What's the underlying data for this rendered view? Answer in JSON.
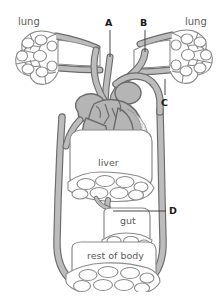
{
  "figure": {
    "background_color": "#ffffff",
    "vessel_fill": "#b9b9b9",
    "vessel_stroke": "#6b6b6b",
    "organ_fill": "#ffffff",
    "capillary_stroke": "#8a8a8a",
    "heart_fill": "#b5b5b5",
    "ventricle_stipple_fill": "#e8e8e8",
    "label_color": "#5a5a5a",
    "letter_color": "#1a1a1a"
  },
  "organs": {
    "lung_left": "lung",
    "lung_right": "lung",
    "liver": "liver",
    "gut": "gut",
    "rest_of_body": "rest of body"
  },
  "letters": {
    "a": "A",
    "b": "B",
    "c": "C",
    "d": "D"
  },
  "structures": [
    {
      "name": "lung-left",
      "type": "capillary-bed",
      "label": "lung"
    },
    {
      "name": "lung-right",
      "type": "capillary-bed",
      "label": "lung"
    },
    {
      "name": "heart",
      "type": "organ",
      "label": ""
    },
    {
      "name": "liver",
      "type": "organ-with-capillary-bed",
      "label": "liver"
    },
    {
      "name": "gut",
      "type": "organ-with-capillary-bed",
      "label": "gut"
    },
    {
      "name": "rest-of-body",
      "type": "organ-with-capillary-bed",
      "label": "rest of body"
    }
  ],
  "leader_lines": [
    {
      "letter": "A",
      "orientation": "vertical",
      "from": [
        110,
        30
      ],
      "to": [
        110,
        57
      ]
    },
    {
      "letter": "B",
      "orientation": "vertical",
      "from": [
        145,
        30
      ],
      "to": [
        145,
        52
      ]
    },
    {
      "letter": "C",
      "orientation": "vertical",
      "from": [
        165,
        79
      ],
      "to": [
        165,
        95
      ]
    },
    {
      "letter": "D",
      "orientation": "horizontal",
      "from": [
        113,
        211
      ],
      "to": [
        166,
        211
      ]
    }
  ]
}
